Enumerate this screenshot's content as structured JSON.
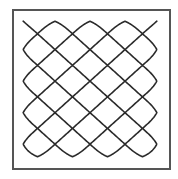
{
  "figure": {
    "frame_color": "#555555",
    "line_color": "#2a2a2a",
    "start_point": [
      22,
      18
    ],
    "end_point": [
      159,
      159
    ],
    "edge_turns": {
      "top_x": [
        45,
        82,
        118,
        153
      ],
      "left_y": [
        45,
        80,
        115,
        148
      ]
    },
    "grid_pitch": 35
  }
}
